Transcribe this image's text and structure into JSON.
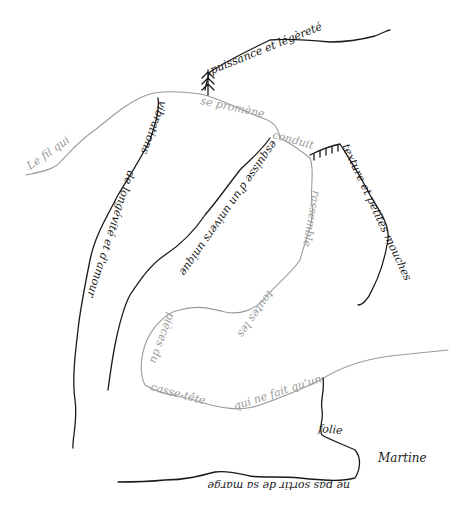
{
  "artwork": {
    "type": "handwritten calligram line drawing",
    "colors": {
      "dark_ink": "#1a1a1a",
      "grey_ink": "#9a9a9a",
      "background": "#ffffff"
    },
    "phrases": {
      "le_fil_qui": "Le fil qui",
      "se_promene": "se promène",
      "conduit": "conduit",
      "rassemble": "rassemble",
      "toutes_les": "toutes les",
      "pieces_du": "pièces du",
      "casse_tete": "casse-tête",
      "qui_ne_fait_quun": "qui ne fait qu'un",
      "puissance_et_legerete": "puissance et légèreté",
      "vibrations": "vibrations",
      "de_longevite_et_damour": "de longévité et d'amour",
      "texture_et_petites_mouches": "texture et petites mouches",
      "esquisse": "esquisse d'un univers unique",
      "folie": "folie",
      "mirrored_bottom": "ne pas sortir de sa marge",
      "signature": "Martine"
    }
  }
}
